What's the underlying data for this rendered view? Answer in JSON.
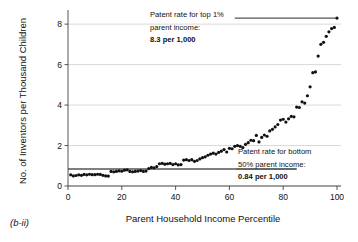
{
  "chart_data": {
    "type": "scatter",
    "title": "",
    "xlabel": "Parent Household Income Percentile",
    "ylabel": "No. of Inventors per Thousand Children",
    "xlim": [
      0,
      100
    ],
    "ylim": [
      0,
      8.6
    ],
    "xticks": [
      0,
      20,
      40,
      60,
      80,
      100
    ],
    "yticks": [
      0,
      2,
      4,
      6,
      8
    ],
    "grid": "horizontal",
    "legend": "none",
    "panel_label": "(b-ii)",
    "series": [
      {
        "name": "Inventors per thousand children by parent income percentile",
        "x": [
          1,
          2,
          3,
          4,
          5,
          6,
          7,
          8,
          9,
          10,
          11,
          12,
          13,
          14,
          15,
          16,
          17,
          18,
          19,
          20,
          21,
          22,
          23,
          24,
          25,
          26,
          27,
          28,
          29,
          30,
          31,
          32,
          33,
          34,
          35,
          36,
          37,
          38,
          39,
          40,
          41,
          42,
          43,
          44,
          45,
          46,
          47,
          48,
          49,
          50,
          51,
          52,
          53,
          54,
          55,
          56,
          57,
          58,
          59,
          60,
          61,
          62,
          63,
          64,
          65,
          66,
          67,
          68,
          69,
          70,
          71,
          72,
          73,
          74,
          75,
          76,
          77,
          78,
          79,
          80,
          81,
          82,
          83,
          84,
          85,
          86,
          87,
          88,
          89,
          90,
          91,
          92,
          93,
          94,
          95,
          96,
          97,
          98,
          99,
          100
        ],
        "y": [
          0.55,
          0.5,
          0.52,
          0.55,
          0.53,
          0.57,
          0.55,
          0.58,
          0.56,
          0.56,
          0.58,
          0.57,
          0.53,
          0.5,
          0.49,
          0.72,
          0.7,
          0.72,
          0.75,
          0.73,
          0.78,
          0.8,
          0.72,
          0.7,
          0.72,
          0.74,
          0.76,
          0.72,
          0.74,
          0.86,
          0.92,
          0.9,
          0.96,
          1.1,
          1.12,
          1.08,
          1.1,
          1.12,
          1.06,
          1.1,
          1.04,
          1.06,
          1.28,
          1.3,
          1.26,
          1.3,
          1.22,
          1.26,
          1.34,
          1.4,
          1.44,
          1.52,
          1.58,
          1.62,
          1.58,
          1.66,
          1.72,
          1.8,
          1.68,
          1.86,
          1.84,
          1.96,
          2.0,
          1.96,
          1.9,
          2.06,
          2.14,
          2.26,
          2.24,
          2.5,
          2.18,
          2.4,
          2.52,
          2.46,
          2.72,
          2.8,
          2.92,
          3.04,
          3.26,
          3.3,
          3.16,
          3.32,
          3.44,
          3.42,
          3.9,
          3.88,
          4.16,
          4.1,
          4.46,
          4.9,
          5.6,
          5.64,
          6.42,
          7.0,
          7.1,
          7.4,
          7.62,
          7.78,
          7.84,
          8.3
        ]
      }
    ],
    "reference_lines": [
      {
        "name": "top-1-percent-line",
        "value": 8.3,
        "x_start": 62,
        "x_end": 100,
        "label_line1": "Patent rate for top 1%",
        "label_line2": "parent income:",
        "label_value": "8.3 per 1,000"
      },
      {
        "name": "bottom-50-percent-line",
        "value": 0.84,
        "x_start": 0,
        "x_end": 85,
        "label_line1": "Patent rate for bottom",
        "label_line2": "50% parent income:",
        "label_value": "0.84 per 1,000"
      }
    ],
    "colors": {
      "dot": "#111111",
      "refline": "#555555",
      "gridline": "#c9c9c9",
      "axis": "#444444",
      "background": "#ffffff"
    }
  }
}
